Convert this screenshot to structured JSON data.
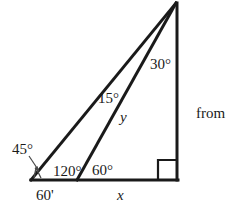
{
  "figure": {
    "kind": "geometry-diagram",
    "background_color": "#ffffff",
    "stroke_color": "#1a1a1a",
    "labels": {
      "angle_apex_right": "30°",
      "angle_apex_between_slants": "15°",
      "angle_left_vertex": "45°",
      "angle_obtuse": "120°",
      "angle_interior_base": "60°",
      "side_slant": "y",
      "base_segment_left": "60'",
      "base_segment_right": "x",
      "text_right": "from"
    },
    "geometry": {
      "apex": [
        176,
        3
      ],
      "left_vertex": [
        31,
        180
      ],
      "mid_base_vertex": [
        77,
        180
      ],
      "right_vertex": [
        178,
        180
      ],
      "right_angle_marker": {
        "x": 158,
        "y": 160,
        "size": 20
      },
      "arrow_from": [
        30,
        155
      ],
      "arrow_to": [
        42,
        172
      ]
    }
  }
}
